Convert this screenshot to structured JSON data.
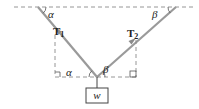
{
  "diagram": {
    "type": "force-diagram",
    "labels": {
      "angle_left_top": "α",
      "angle_right_top": "β",
      "angle_left_bottom": "α",
      "angle_right_bottom": "β",
      "tension_left": "T",
      "tension_left_sub": "1",
      "tension_right": "T",
      "tension_right_sub": "2",
      "weight": "w"
    },
    "colors": {
      "cable": "#9a9a9a",
      "dashed": "#8a8a8a",
      "text": "#222222"
    }
  }
}
